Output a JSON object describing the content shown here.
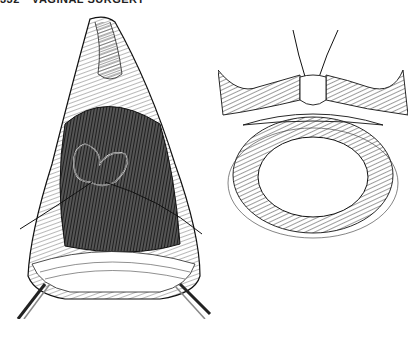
{
  "header": {
    "page_number": "332",
    "running_title": "VAGINAL SURGERY"
  },
  "figures": [
    {
      "id": "left",
      "description": "Engraving of a surgical field through the vagina with retractors and a purse-string suture looped around tissue"
    },
    {
      "id": "right",
      "description": "Cross-section diagram showing suture drawing together tissue layers above a ring-shaped lumen"
    }
  ],
  "colors": {
    "ink": "#111111",
    "paper": "#ffffff"
  }
}
